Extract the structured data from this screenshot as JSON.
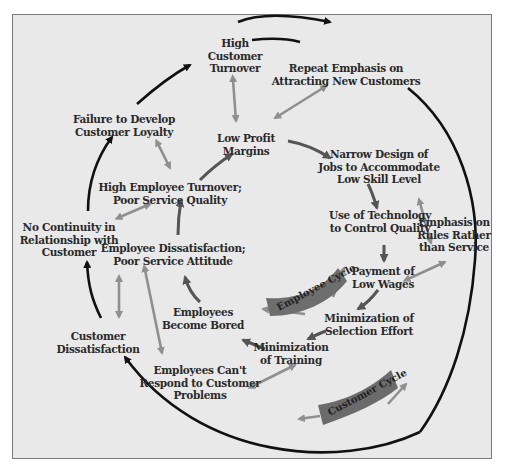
{
  "diagram": {
    "type": "causal-loop",
    "cycles": [
      {
        "name": "employee-cycle",
        "label": "Employee Cycle"
      },
      {
        "name": "customer-cycle",
        "label": "Customer Cycle"
      }
    ],
    "nodes": {
      "high_customer_turnover": "High\nCustomer\nTurnover",
      "repeat_emphasis": "Repeat Emphasis on\nAttracting New Customers",
      "failure_loyalty": "Failure to Develop\nCustomer Loyalty",
      "low_profit": "Low Profit\nMargins",
      "narrow_design": "Narrow Design of\nJobs to Accommodate\nLow Skill Level",
      "high_employee_turnover": "High Employee Turnover;\nPoor Service Quality",
      "no_continuity": "No Continuity in\nRelationship with\nCustomer",
      "use_technology": "Use of Technology\nto Control Quality",
      "emphasis_rules": "Emphasis on\nRules Rather\nthan Service",
      "employee_dissatisfaction": "Employee Dissatisfaction;\nPoor Service Attitude",
      "payment_low_wages": "Payment of\nLow Wages",
      "employees_bored": "Employees\nBecome Bored",
      "minimization_selection": "Minimization of\nSelection Effort",
      "customer_dissatisfaction": "Customer\nDissatisfaction",
      "minimization_training": "Minimization\nof Training",
      "employees_cant_respond": "Employees Can't\nRespond to Customer\nProblems"
    },
    "colors": {
      "background": "#e9e9e9",
      "frame_border": "#7a7a7a",
      "customer_arrow": "#111111",
      "employee_arrow": "#555555",
      "link_arrow": "#8f8f8f",
      "band_fill": "#6b6b6b",
      "text": "#2a2a2a"
    }
  }
}
